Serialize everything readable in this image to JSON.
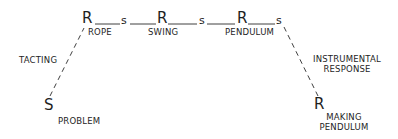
{
  "diagram": {
    "chain": [
      {
        "symbol": "R",
        "label": "ROPE"
      },
      {
        "symbol": "s"
      },
      {
        "symbol": "R",
        "label": "SWING"
      },
      {
        "symbol": "s"
      },
      {
        "symbol": "R",
        "label": "PENDULUM"
      },
      {
        "symbol": "s"
      }
    ],
    "start": {
      "symbol": "S",
      "label": "PROBLEM"
    },
    "end": {
      "symbol": "R",
      "label_line1": "MAKING",
      "label_line2": "PENDULUM"
    },
    "left_link_label": "TACTING",
    "right_link_label_line1": "INSTRUMENTAL",
    "right_link_label_line2": "RESPONSE"
  }
}
